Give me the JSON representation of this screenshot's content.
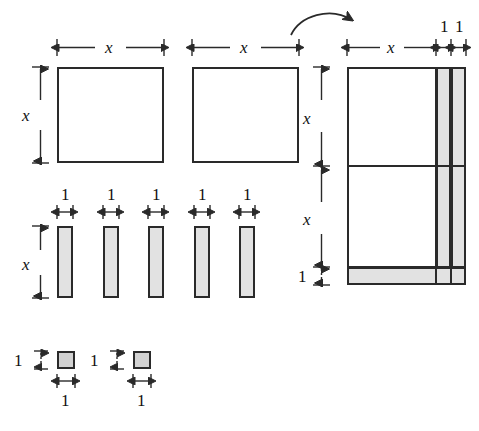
{
  "figure": {
    "colors": {
      "tile_border": "#2a2a2a",
      "tile_x_squared_fill": "#ffffff",
      "tile_x_fill": "#e2e2e2",
      "tile_unit_fill": "#d2d2d2",
      "dimension_line": "#2a2a2a",
      "background": "#ffffff"
    },
    "labels": {
      "x": "x",
      "one": "1"
    },
    "arrow": {
      "name": "rearrange-arrow",
      "shape": "curved-arrow-right"
    },
    "left_group": {
      "x_squared_tiles": [
        {
          "id": "x2-tile-1",
          "top_label": "x",
          "left_label": "x"
        },
        {
          "id": "x2-tile-2",
          "top_label": "x",
          "left_label": null
        }
      ],
      "x_squared_bottom_ticks": [
        "1",
        "1",
        "1",
        "1",
        "1"
      ],
      "x_tiles": [
        {
          "id": "x-tile-1",
          "top_label": "1",
          "left_label": "x"
        },
        {
          "id": "x-tile-2",
          "top_label": "1",
          "left_label": null
        },
        {
          "id": "x-tile-3",
          "top_label": "1",
          "left_label": null
        },
        {
          "id": "x-tile-4",
          "top_label": "1",
          "left_label": null
        },
        {
          "id": "x-tile-5",
          "top_label": "1",
          "left_label": null
        }
      ],
      "unit_tiles": [
        {
          "id": "unit-tile-1",
          "left_label": "1",
          "bottom_label": "1"
        },
        {
          "id": "unit-tile-2",
          "left_label": "1",
          "bottom_label": "1"
        }
      ]
    },
    "right_group": {
      "top_labels": [
        "x",
        "1",
        "1"
      ],
      "left_labels": [
        "x",
        "x",
        "1"
      ],
      "description": "Combined rectangle of width x+2 and height 2x+1"
    }
  }
}
